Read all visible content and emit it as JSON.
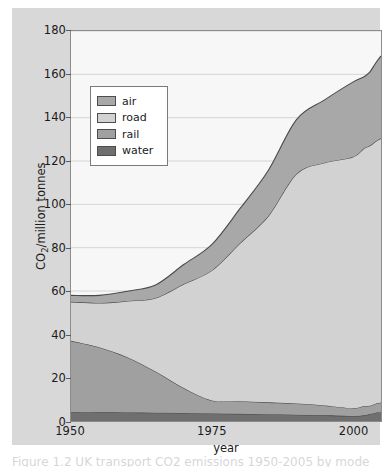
{
  "figure": {
    "caption": "Figure 1.2 UK transport CO2 emissions 1950-2005 by mode",
    "background_color": "#d8d8d8",
    "panel_color": "#f7f7f7"
  },
  "axes": {
    "y_title_main": "CO",
    "y_title_sub": "2",
    "y_title_rest": "/million tonnes",
    "x_title": "year",
    "y_ticks": [
      "0",
      "20",
      "40",
      "60",
      "80",
      "100",
      "120",
      "140",
      "160",
      "180"
    ],
    "x_ticks": [
      "1950",
      "1975",
      "2000"
    ]
  },
  "legend": {
    "items": [
      {
        "label": "air",
        "color": "#a8a8a8"
      },
      {
        "label": "road",
        "color": "#d2d2d2"
      },
      {
        "label": "rail",
        "color": "#a0a0a0"
      },
      {
        "label": "water",
        "color": "#6f6f6f"
      }
    ]
  },
  "chart_data": {
    "type": "area",
    "title": "",
    "xlabel": "year",
    "ylabel": "CO2/million tonnes",
    "xlim": [
      1950,
      2005
    ],
    "ylim": [
      0,
      180
    ],
    "ytick_step": 20,
    "grid": true,
    "legend_position": "top-left",
    "stacked": true,
    "stack_order_bottom_to_top": [
      "water",
      "rail",
      "road",
      "air"
    ],
    "x": [
      1950,
      1955,
      1960,
      1965,
      1970,
      1975,
      1980,
      1985,
      1990,
      1995,
      2000,
      2002,
      2003,
      2004,
      2005
    ],
    "series": [
      {
        "name": "water",
        "color": "#6f6f6f",
        "values": [
          4.0,
          4.0,
          3.9,
          3.8,
          3.7,
          3.5,
          3.3,
          3.1,
          2.9,
          2.6,
          2.3,
          2.6,
          3.2,
          3.8,
          4.2
        ]
      },
      {
        "name": "rail",
        "color": "#a0a0a0",
        "values": [
          33.0,
          30.0,
          25.5,
          19.0,
          11.5,
          6.0,
          5.8,
          5.5,
          5.2,
          4.6,
          3.6,
          4.3,
          3.8,
          4.2,
          4.3
        ]
      },
      {
        "name": "road",
        "color": "#d2d2d2",
        "values": [
          18.0,
          20.5,
          26.0,
          34.0,
          48.0,
          60.0,
          73.0,
          86.0,
          106.0,
          112.0,
          116.0,
          119.0,
          120.0,
          121.0,
          122.0
        ]
      },
      {
        "name": "air",
        "color": "#a8a8a8",
        "values": [
          3.0,
          3.5,
          4.5,
          6.0,
          9.0,
          12.0,
          16.0,
          21.0,
          25.0,
          29.0,
          34.5,
          33.0,
          34.0,
          36.0,
          38.0
        ]
      }
    ],
    "stacked_totals": [
      58.0,
      58.0,
      59.9,
      62.8,
      72.2,
      81.5,
      98.1,
      115.6,
      139.1,
      148.2,
      156.4,
      158.9,
      161.0,
      165.0,
      168.5
    ]
  }
}
